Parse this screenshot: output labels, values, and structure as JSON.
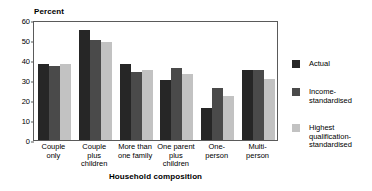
{
  "chart_data": {
    "type": "bar",
    "title": "",
    "subtitle": "",
    "xlabel": "Household composition",
    "ylabel": "Percent",
    "ylim": [
      0,
      60
    ],
    "ytick_values": [
      60,
      50,
      40,
      30,
      20,
      10,
      0
    ],
    "ytick_labels": [
      "60",
      "50",
      "40",
      "30",
      "20",
      "10",
      "0"
    ],
    "grid": false,
    "legend_position": "right",
    "categories": [
      "Couple\nonly",
      "Couple\nplus\nchildren",
      "More than\none family",
      "One parent\nplus\nchildren",
      "One-\nperson",
      "Multi-\nperson"
    ],
    "series": [
      {
        "name": "Actual",
        "color": "#262626",
        "values": [
          38,
          55,
          38,
          30,
          16,
          35
        ]
      },
      {
        "name": "Income-\nstandardised",
        "color": "#4a4a4a",
        "values": [
          37,
          50,
          34,
          36,
          26,
          35
        ]
      },
      {
        "name": "Highest\nqualification-\nstandardised",
        "color": "#c2c2c2",
        "values": [
          38,
          49,
          35,
          33,
          22,
          30.5
        ]
      }
    ]
  },
  "axis": {
    "y_title": "Percent",
    "x_title": "Household composition"
  },
  "colors": {
    "axis_line": "#5a5a5a",
    "text": "#000000",
    "background": "#ffffff",
    "series_actual": "#262626",
    "series_income": "#4a4a4a",
    "series_qualification": "#c2c2c2"
  }
}
